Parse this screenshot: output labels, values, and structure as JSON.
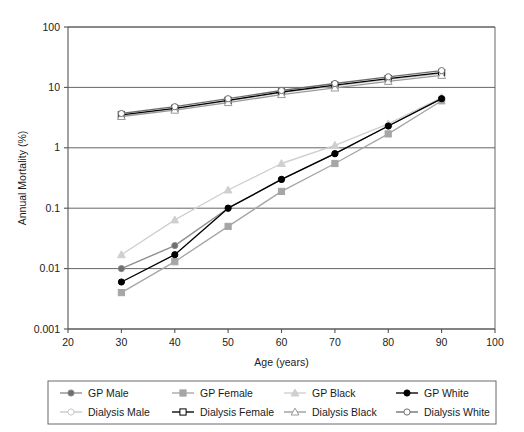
{
  "chart_data": {
    "type": "line",
    "title": "",
    "xlabel": "Age (years)",
    "ylabel": "Annual Mortality (%)",
    "xlim": [
      20,
      100
    ],
    "ylim": [
      0.001,
      100
    ],
    "yscale": "log",
    "xticks": [
      20,
      30,
      40,
      50,
      60,
      70,
      80,
      90,
      100
    ],
    "xtick_labels": [
      "20",
      "30",
      "40",
      "50",
      "60",
      "70",
      "80",
      "90",
      "100"
    ],
    "yticks": [
      0.001,
      0.01,
      0.1,
      1,
      10,
      100
    ],
    "ytick_labels": [
      "0.001",
      "0.01",
      "0.1",
      "1",
      "10",
      "100"
    ],
    "grid": "horizontal",
    "legend_position": "bottom",
    "x": [
      30,
      40,
      50,
      60,
      70,
      80,
      90
    ],
    "series": [
      {
        "name": "GP Male",
        "marker": "circle",
        "marker_fill": "#6e6e6e",
        "color": "#8c8c8c",
        "values": [
          0.01,
          0.024,
          0.1,
          0.3,
          0.8,
          2.3,
          6.5
        ]
      },
      {
        "name": "GP Female",
        "marker": "square",
        "marker_fill": "#a6a6a6",
        "color": "#a6a6a6",
        "values": [
          0.004,
          0.013,
          0.05,
          0.19,
          0.55,
          1.7,
          6.0
        ]
      },
      {
        "name": "GP Black",
        "marker": "triangle",
        "marker_fill": "#cfcfcf",
        "color": "#cfcfcf",
        "values": [
          0.017,
          0.064,
          0.2,
          0.55,
          1.1,
          2.5,
          6.8
        ]
      },
      {
        "name": "GP White",
        "marker": "circle",
        "marker_fill": "#000000",
        "color": "#000000",
        "values": [
          0.006,
          0.017,
          0.1,
          0.3,
          0.8,
          2.3,
          6.5
        ]
      },
      {
        "name": "Dialysis Male",
        "marker": "circle-open",
        "marker_fill": "#ffffff",
        "color": "#c9c9c9",
        "values": [
          3.4,
          4.4,
          6.0,
          8.2,
          10.6,
          13.6,
          17.0
        ]
      },
      {
        "name": "Dialysis Female",
        "marker": "square-open",
        "marker_fill": "#ffffff",
        "color": "#000000",
        "values": [
          3.5,
          4.5,
          6.1,
          8.4,
          10.9,
          14.0,
          17.6
        ]
      },
      {
        "name": "Dialysis Black",
        "marker": "triangle-open",
        "marker_fill": "#ffffff",
        "color": "#9a9a9a",
        "values": [
          3.3,
          4.2,
          5.6,
          7.6,
          9.8,
          12.6,
          15.8
        ]
      },
      {
        "name": "Dialysis White",
        "marker": "circle-open",
        "marker_fill": "#ffffff",
        "color": "#6e6e6e",
        "values": [
          3.7,
          4.8,
          6.5,
          8.9,
          11.6,
          15.0,
          19.0
        ]
      }
    ]
  },
  "legend": {
    "rows": [
      [
        "GP Male",
        "GP Female",
        "GP Black",
        "GP White"
      ],
      [
        "Dialysis Male",
        "Dialysis Female",
        "Dialysis Black",
        "Dialysis White"
      ]
    ]
  },
  "colors": {
    "axis": "#555555",
    "grid": "#555555",
    "background": "#ffffff",
    "text": "#1b1b1b"
  }
}
